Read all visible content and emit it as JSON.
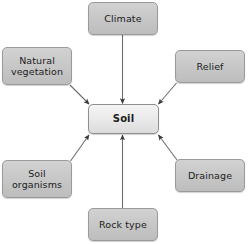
{
  "diagram": {
    "type": "spider-concept-map",
    "title_text": "",
    "center": {
      "id": "soil",
      "label": "Soil",
      "bold": true,
      "fill": "#eaeaea",
      "border": "#8f8f8f"
    },
    "nodes": [
      {
        "id": "climate",
        "label": "Climate",
        "fill": "#c6c6c6",
        "border": "#9a9a9a"
      },
      {
        "id": "natural-veg",
        "label": "Natural\nvegetation",
        "fill": "#c6c6c6",
        "border": "#9a9a9a"
      },
      {
        "id": "relief",
        "label": "Relief",
        "fill": "#c6c6c6",
        "border": "#9a9a9a"
      },
      {
        "id": "soil-organisms",
        "label": "Soil\norganisms",
        "fill": "#c6c6c6",
        "border": "#9a9a9a"
      },
      {
        "id": "drainage",
        "label": "Drainage",
        "fill": "#c6c6c6",
        "border": "#9a9a9a"
      },
      {
        "id": "rock-type",
        "label": "Rock type",
        "fill": "#c6c6c6",
        "border": "#9a9a9a"
      }
    ],
    "connectors": [
      {
        "id": "climate-to-soil",
        "from": "climate",
        "to": "soil",
        "direction": "down",
        "arrowhead": "filled-triangle"
      },
      {
        "id": "natural-veg-to-soil",
        "from": "natural-veg",
        "to": "soil",
        "direction": "down-right",
        "arrowhead": "filled-triangle"
      },
      {
        "id": "relief-to-soil",
        "from": "relief",
        "to": "soil",
        "direction": "down-left",
        "arrowhead": "filled-triangle"
      },
      {
        "id": "soil-organisms-to-soil",
        "from": "soil-organisms",
        "to": "soil",
        "direction": "up-right",
        "arrowhead": "filled-triangle"
      },
      {
        "id": "drainage-to-soil",
        "from": "drainage",
        "to": "soil",
        "direction": "up-left",
        "arrowhead": "filled-triangle"
      },
      {
        "id": "rock-type-to-soil",
        "from": "rock-type",
        "to": "soil",
        "direction": "up",
        "arrowhead": "filled-triangle"
      }
    ],
    "line_color": "#6e6e6e",
    "background": "#ffffff"
  }
}
